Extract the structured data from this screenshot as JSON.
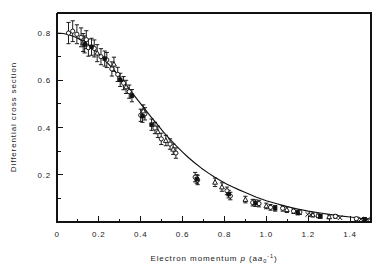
{
  "figure": {
    "background_color": "#ffffff",
    "ink_color": "#111111"
  },
  "chart_data": {
    "type": "scatter",
    "title": "",
    "subtitle": "",
    "xlabel_main": "Electron momentum",
    "xlabel_symbol": "p",
    "xlabel_unit_open": "(a",
    "xlabel_unit_sub": "0",
    "xlabel_unit_sup": "-1",
    "xlabel_unit_close": ")",
    "xlabel_full": "Electron momentum p (a0^-1)",
    "ylabel": "Differential cross section",
    "xlim": [
      0,
      1.5
    ],
    "ylim": [
      0,
      0.885
    ],
    "grid": false,
    "legend": "none",
    "x_major_ticks": [
      0,
      0.2,
      0.4,
      0.6,
      0.8,
      1.0,
      1.2,
      1.4
    ],
    "x_major_tick_labels": [
      "0",
      "0.2",
      "0.4",
      "0.6",
      "0.8",
      "1.0",
      "1.2",
      "1.4"
    ],
    "x_minor_ticks": [
      0.1,
      0.3,
      0.5,
      0.7,
      0.9,
      1.1,
      1.3,
      1.5
    ],
    "y_major_ticks": [
      0.2,
      0.4,
      0.6,
      0.8
    ],
    "y_major_tick_labels": [
      "0.2",
      "0.4",
      "0.6",
      "0.8"
    ],
    "y_minor_ticks": [
      0.1,
      0.3,
      0.5,
      0.7
    ],
    "fit_curve": {
      "name": "theoretical curve",
      "x": [
        0.0,
        0.03,
        0.06,
        0.09,
        0.12,
        0.15,
        0.18,
        0.21,
        0.24,
        0.27,
        0.3,
        0.33,
        0.36,
        0.39,
        0.42,
        0.45,
        0.48,
        0.51,
        0.54,
        0.57,
        0.6,
        0.63,
        0.66,
        0.69,
        0.72,
        0.75,
        0.78,
        0.81,
        0.84,
        0.87,
        0.9,
        0.95,
        1.0,
        1.05,
        1.1,
        1.15,
        1.2,
        1.25,
        1.3,
        1.35,
        1.4,
        1.45,
        1.5
      ],
      "y": [
        0.8,
        0.798,
        0.792,
        0.782,
        0.768,
        0.75,
        0.728,
        0.703,
        0.675,
        0.645,
        0.613,
        0.58,
        0.546,
        0.512,
        0.478,
        0.444,
        0.412,
        0.38,
        0.35,
        0.322,
        0.296,
        0.271,
        0.249,
        0.228,
        0.209,
        0.192,
        0.176,
        0.161,
        0.148,
        0.136,
        0.125,
        0.106,
        0.09,
        0.077,
        0.065,
        0.055,
        0.046,
        0.039,
        0.032,
        0.026,
        0.021,
        0.016,
        0.012
      ]
    },
    "series": [
      {
        "name": "open circles",
        "marker": "circle-open",
        "points": [
          {
            "x": 0.055,
            "y": 0.8,
            "err": 0.045
          },
          {
            "x": 0.075,
            "y": 0.808,
            "err": 0.044
          },
          {
            "x": 0.095,
            "y": 0.795,
            "err": 0.04
          },
          {
            "x": 0.115,
            "y": 0.782,
            "err": 0.04
          },
          {
            "x": 0.14,
            "y": 0.772,
            "err": 0.038
          },
          {
            "x": 0.15,
            "y": 0.738,
            "err": 0.036
          },
          {
            "x": 0.178,
            "y": 0.735,
            "err": 0.036
          },
          {
            "x": 0.21,
            "y": 0.7,
            "err": 0.034
          },
          {
            "x": 0.238,
            "y": 0.686,
            "err": 0.032
          },
          {
            "x": 0.262,
            "y": 0.648,
            "err": 0.03
          },
          {
            "x": 0.29,
            "y": 0.625,
            "err": 0.03
          },
          {
            "x": 0.318,
            "y": 0.588,
            "err": 0.028
          },
          {
            "x": 0.345,
            "y": 0.552,
            "err": 0.028
          },
          {
            "x": 0.4,
            "y": 0.452,
            "err": 0.026
          },
          {
            "x": 0.42,
            "y": 0.458,
            "err": 0.026
          },
          {
            "x": 0.468,
            "y": 0.398,
            "err": 0.024
          },
          {
            "x": 0.498,
            "y": 0.352,
            "err": 0.024
          },
          {
            "x": 0.54,
            "y": 0.33,
            "err": 0.022
          },
          {
            "x": 0.568,
            "y": 0.292,
            "err": 0.022
          },
          {
            "x": 0.66,
            "y": 0.19,
            "err": 0.02
          },
          {
            "x": 0.672,
            "y": 0.178,
            "err": 0.02
          },
          {
            "x": 0.812,
            "y": 0.132,
            "err": 0.016
          },
          {
            "x": 0.828,
            "y": 0.11,
            "err": 0.016
          },
          {
            "x": 0.935,
            "y": 0.082,
            "err": 0.014
          },
          {
            "x": 0.965,
            "y": 0.078,
            "err": 0.014
          },
          {
            "x": 1.02,
            "y": 0.062,
            "err": 0.012
          },
          {
            "x": 1.078,
            "y": 0.058,
            "err": 0.012
          },
          {
            "x": 1.13,
            "y": 0.046,
            "err": 0.01
          },
          {
            "x": 1.16,
            "y": 0.042,
            "err": 0.01
          },
          {
            "x": 1.248,
            "y": 0.026,
            "err": 0.008
          },
          {
            "x": 1.33,
            "y": 0.024,
            "err": 0.008
          },
          {
            "x": 1.43,
            "y": 0.014,
            "err": 0.006
          }
        ]
      },
      {
        "name": "triangles",
        "marker": "triangle-open",
        "points": [
          {
            "x": 0.125,
            "y": 0.76,
            "err": 0.038
          },
          {
            "x": 0.192,
            "y": 0.715,
            "err": 0.036
          },
          {
            "x": 0.272,
            "y": 0.668,
            "err": 0.03
          },
          {
            "x": 0.33,
            "y": 0.572,
            "err": 0.028
          },
          {
            "x": 0.412,
            "y": 0.47,
            "err": 0.026
          },
          {
            "x": 0.482,
            "y": 0.382,
            "err": 0.024
          },
          {
            "x": 0.52,
            "y": 0.345,
            "err": 0.022
          },
          {
            "x": 0.555,
            "y": 0.308,
            "err": 0.022
          },
          {
            "x": 0.755,
            "y": 0.168,
            "err": 0.018
          },
          {
            "x": 0.788,
            "y": 0.148,
            "err": 0.018
          },
          {
            "x": 0.9,
            "y": 0.095,
            "err": 0.014
          },
          {
            "x": 1.0,
            "y": 0.068,
            "err": 0.012
          },
          {
            "x": 1.098,
            "y": 0.052,
            "err": 0.012
          },
          {
            "x": 1.222,
            "y": 0.03,
            "err": 0.008
          },
          {
            "x": 1.3,
            "y": 0.022,
            "err": 0.008
          }
        ]
      },
      {
        "name": "filled squares",
        "marker": "square-filled",
        "points": [
          {
            "x": 0.132,
            "y": 0.752,
            "err": 0.036
          },
          {
            "x": 0.165,
            "y": 0.742,
            "err": 0.036
          },
          {
            "x": 0.228,
            "y": 0.692,
            "err": 0.032
          },
          {
            "x": 0.302,
            "y": 0.602,
            "err": 0.028
          },
          {
            "x": 0.358,
            "y": 0.535,
            "err": 0.026
          },
          {
            "x": 0.408,
            "y": 0.448,
            "err": 0.026
          },
          {
            "x": 0.452,
            "y": 0.412,
            "err": 0.024
          },
          {
            "x": 0.668,
            "y": 0.182,
            "err": 0.018
          },
          {
            "x": 0.82,
            "y": 0.118,
            "err": 0.016
          },
          {
            "x": 0.948,
            "y": 0.08,
            "err": 0.014
          },
          {
            "x": 1.042,
            "y": 0.058,
            "err": 0.012
          },
          {
            "x": 1.15,
            "y": 0.04,
            "err": 0.01
          },
          {
            "x": 1.258,
            "y": 0.024,
            "err": 0.008
          },
          {
            "x": 1.47,
            "y": 0.012,
            "err": 0.006
          }
        ]
      },
      {
        "name": "crosses",
        "marker": "cross",
        "points": [
          {
            "x": 1.198,
            "y": 0.032,
            "err": 0.0
          },
          {
            "x": 1.212,
            "y": 0.03,
            "err": 0.0
          },
          {
            "x": 1.352,
            "y": 0.018,
            "err": 0.0
          },
          {
            "x": 1.452,
            "y": 0.012,
            "err": 0.0
          },
          {
            "x": 1.482,
            "y": 0.01,
            "err": 0.0
          }
        ]
      }
    ]
  }
}
